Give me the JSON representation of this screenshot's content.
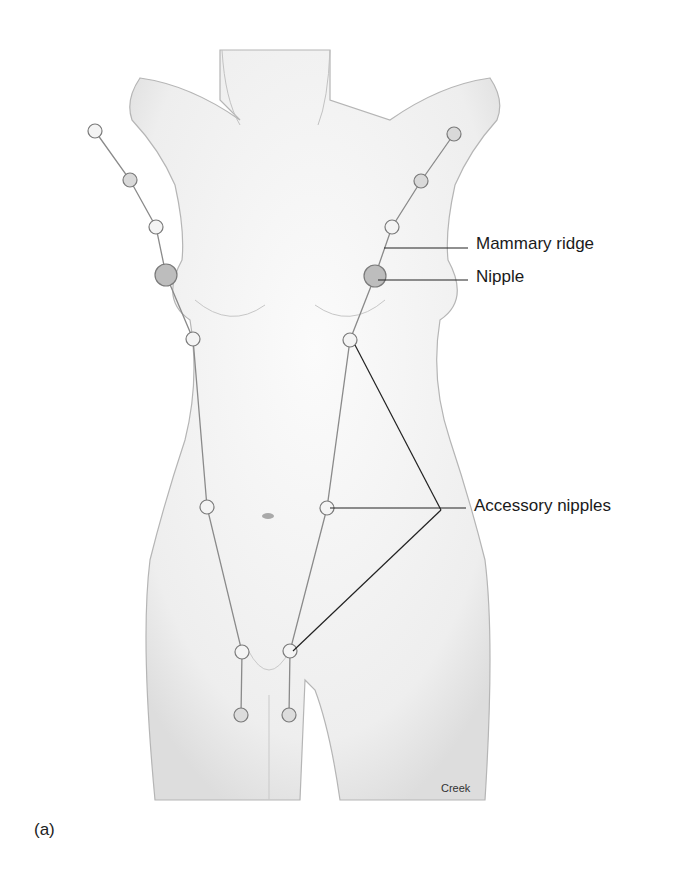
{
  "diagram": {
    "labels": {
      "mammary_ridge": "Mammary ridge",
      "nipple": "Nipple",
      "accessory_nipples": "Accessory nipples"
    },
    "credit": "Creek",
    "panel_label": "(a)",
    "colors": {
      "outline": "#9a9a9a",
      "shade": "#e6e6e6",
      "ridge_line": "#8a8a8a",
      "node_stroke": "#7a7a7a",
      "leader": "#222222"
    }
  }
}
